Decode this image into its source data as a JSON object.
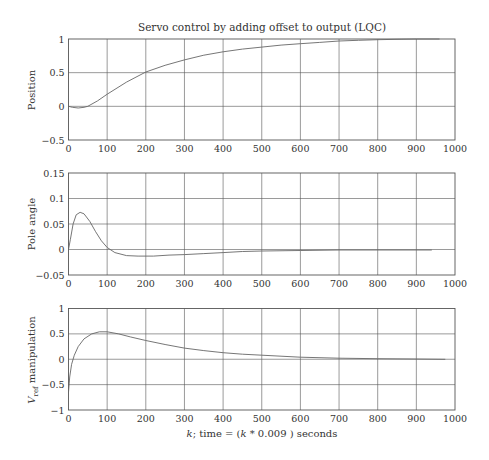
{
  "figure": {
    "title": "Servo control by adding offset to output (LQC)",
    "xlabel_parts": {
      "k": "k",
      "rest": "; time = (",
      "k2": "k",
      "tail": " * 0.009 ) seconds"
    }
  },
  "chart_data": [
    {
      "type": "line",
      "title": "Servo control by adding offset to output (LQC)",
      "xlabel": "",
      "ylabel": "Position",
      "xlim": [
        0,
        1000
      ],
      "ylim": [
        -0.5,
        1
      ],
      "grid": true,
      "xticks": [
        "0",
        "100",
        "200",
        "300",
        "400",
        "500",
        "600",
        "700",
        "800",
        "900",
        "1000"
      ],
      "yticks": [
        "-0.5",
        "0",
        "0.5",
        "1"
      ],
      "series": [
        {
          "name": "Position",
          "x": [
            0,
            10,
            25,
            40,
            50,
            75,
            100,
            150,
            200,
            250,
            300,
            350,
            400,
            450,
            500,
            550,
            600,
            650,
            700,
            750,
            800,
            850,
            900,
            960
          ],
          "y": [
            0,
            -0.015,
            -0.025,
            -0.015,
            0.0,
            0.08,
            0.18,
            0.36,
            0.51,
            0.61,
            0.69,
            0.76,
            0.81,
            0.85,
            0.88,
            0.91,
            0.93,
            0.95,
            0.97,
            0.98,
            0.99,
            0.995,
            1.0,
            1.0
          ]
        }
      ]
    },
    {
      "type": "line",
      "xlabel": "",
      "ylabel": "Pole angle",
      "xlim": [
        0,
        1000
      ],
      "ylim": [
        -0.05,
        0.15
      ],
      "grid": true,
      "xticks": [
        "0",
        "100",
        "200",
        "300",
        "400",
        "500",
        "600",
        "700",
        "800",
        "900",
        "1000"
      ],
      "yticks": [
        "-0.05",
        "0",
        "0.05",
        "0.1",
        "0.15"
      ],
      "series": [
        {
          "name": "Pole angle",
          "x": [
            0,
            5,
            12,
            20,
            30,
            40,
            55,
            70,
            85,
            100,
            120,
            150,
            180,
            220,
            260,
            300,
            350,
            400,
            450,
            500,
            600,
            700,
            800,
            940
          ],
          "y": [
            0,
            0.02,
            0.05,
            0.068,
            0.073,
            0.07,
            0.055,
            0.035,
            0.017,
            0.004,
            -0.006,
            -0.012,
            -0.013,
            -0.013,
            -0.011,
            -0.01,
            -0.008,
            -0.006,
            -0.004,
            -0.003,
            -0.002,
            -0.001,
            -0.001,
            -0.001
          ]
        }
      ]
    },
    {
      "type": "line",
      "xlabel": "k; time = (k * 0.009 ) seconds",
      "ylabel": "V_ref manipulation",
      "xlim": [
        0,
        1000
      ],
      "ylim": [
        -1,
        1
      ],
      "grid": true,
      "xticks": [
        "0",
        "100",
        "200",
        "300",
        "400",
        "500",
        "600",
        "700",
        "800",
        "900",
        "1000"
      ],
      "yticks": [
        "-1",
        "-0.5",
        "0",
        "0.5",
        "1"
      ],
      "series": [
        {
          "name": "V_ref manipulation",
          "x": [
            0,
            3,
            8,
            15,
            25,
            40,
            60,
            80,
            100,
            130,
            160,
            200,
            250,
            300,
            350,
            400,
            450,
            500,
            600,
            700,
            800,
            900,
            975
          ],
          "y": [
            -0.65,
            -0.35,
            -0.1,
            0.08,
            0.25,
            0.4,
            0.5,
            0.54,
            0.54,
            0.5,
            0.44,
            0.37,
            0.29,
            0.22,
            0.17,
            0.13,
            0.1,
            0.08,
            0.04,
            0.02,
            0.01,
            0.005,
            0.0
          ]
        }
      ]
    }
  ],
  "ylabels": {
    "position": "Position",
    "pole": "Pole angle",
    "vref_main": "V",
    "vref_sub": "ref",
    "vref_tail": " manipulation"
  }
}
